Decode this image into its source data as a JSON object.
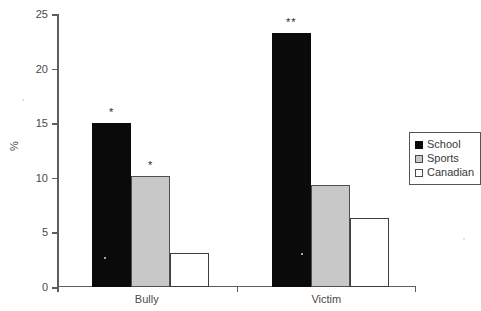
{
  "chart_data": {
    "type": "bar",
    "title": "",
    "xlabel": "",
    "ylabel": "%",
    "ylim": [
      0,
      25
    ],
    "yticks": [
      0,
      5,
      10,
      15,
      20,
      25
    ],
    "grid": false,
    "legend_position": "right",
    "categories": [
      "Bully",
      "Victim"
    ],
    "series": [
      {
        "name": "School",
        "color": "#0a0a0a",
        "values": [
          15.0,
          23.3
        ]
      },
      {
        "name": "Sports",
        "color": "#c8c8c8",
        "values": [
          10.2,
          9.3
        ]
      },
      {
        "name": "Canadian",
        "color": "#ffffff",
        "values": [
          3.1,
          6.3
        ]
      }
    ],
    "annotations": [
      {
        "label": "*",
        "category": "Bully",
        "series": "School"
      },
      {
        "label": "*",
        "category": "Bully",
        "series": "Sports"
      },
      {
        "label": "**",
        "category": "Victim",
        "series": "School"
      }
    ]
  },
  "axis": {
    "y_tick_labels": [
      "0",
      "5",
      "10",
      "15",
      "20",
      "25"
    ],
    "y_title": "%"
  },
  "categories": {
    "bully": "Bully",
    "victim": "Victim"
  },
  "legend": {
    "items": [
      {
        "label": "School"
      },
      {
        "label": "Sports"
      },
      {
        "label": "Canadian"
      }
    ]
  }
}
